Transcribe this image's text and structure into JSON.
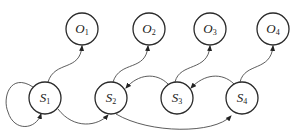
{
  "diagram": {
    "type": "state-observation graph",
    "colors": {
      "stroke": "#2a2a2a",
      "edge": "#4a4a4a",
      "background": "#ffffff"
    },
    "observations": [
      {
        "id": "O1",
        "base": "O",
        "sub": "1",
        "x": 82,
        "y": 29
      },
      {
        "id": "O2",
        "base": "O",
        "sub": "2",
        "x": 149,
        "y": 29
      },
      {
        "id": "O3",
        "base": "O",
        "sub": "3",
        "x": 210,
        "y": 29
      },
      {
        "id": "O4",
        "base": "O",
        "sub": "4",
        "x": 273,
        "y": 29
      }
    ],
    "states": [
      {
        "id": "S1",
        "base": "S",
        "sub": "1",
        "x": 45,
        "y": 98
      },
      {
        "id": "S2",
        "base": "S",
        "sub": "2",
        "x": 111,
        "y": 98
      },
      {
        "id": "S3",
        "base": "S",
        "sub": "3",
        "x": 177,
        "y": 98
      },
      {
        "id": "S4",
        "base": "S",
        "sub": "4",
        "x": 242,
        "y": 98
      }
    ],
    "edges": [
      {
        "from": "S1",
        "to": "S1",
        "kind": "self-loop"
      },
      {
        "from": "S1",
        "to": "O1",
        "kind": "emission"
      },
      {
        "from": "S2",
        "to": "O2",
        "kind": "emission"
      },
      {
        "from": "S3",
        "to": "O3",
        "kind": "emission"
      },
      {
        "from": "S4",
        "to": "O4",
        "kind": "emission"
      },
      {
        "from": "S1",
        "to": "S2",
        "kind": "transition"
      },
      {
        "from": "S3",
        "to": "S2",
        "kind": "transition"
      },
      {
        "from": "S4",
        "to": "S3",
        "kind": "transition"
      },
      {
        "from": "S2",
        "to": "S4",
        "kind": "transition"
      }
    ]
  }
}
